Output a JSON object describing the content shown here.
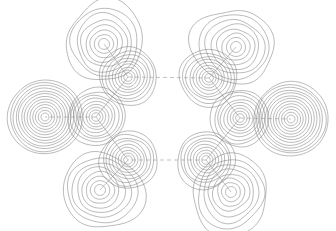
{
  "figure": {
    "title": "",
    "caption": "",
    "background_color": "#ffffff",
    "width": 336,
    "height": 231,
    "contour_color": "#808080",
    "bond_color": "#9a9a9a"
  },
  "chart_data": {
    "type": "contour",
    "title": "",
    "subtitle": "",
    "xlabel": "",
    "ylabel": "",
    "xlim": [
      0,
      336
    ],
    "ylim": [
      0,
      231
    ],
    "grid": false,
    "legend": null,
    "axes_visible": false,
    "tick_labels_x": [],
    "tick_labels_y": [],
    "annotations": [],
    "contour_levels": [
      0.002,
      0.004,
      0.008,
      0.02,
      0.04,
      0.08,
      0.2,
      0.4
    ],
    "ring_center": [
      168,
      115
    ],
    "ring_radius": 55,
    "sites": [
      {
        "id": "ring-atom-1",
        "role": "ring",
        "label": "",
        "center": [
          128,
          77
        ],
        "rings": 9,
        "max_radius": 27,
        "shape": "round",
        "angle_deg": 135
      },
      {
        "id": "ring-atom-2",
        "role": "ring",
        "label": "",
        "center": [
          209,
          78
        ],
        "rings": 9,
        "max_radius": 27,
        "shape": "round",
        "angle_deg": 45
      },
      {
        "id": "ring-atom-3",
        "role": "ring",
        "label": "",
        "center": [
          240,
          118
        ],
        "rings": 9,
        "max_radius": 27,
        "shape": "round",
        "angle_deg": 0
      },
      {
        "id": "ring-atom-4",
        "role": "ring",
        "label": "",
        "center": [
          206,
          160
        ],
        "rings": 9,
        "max_radius": 27,
        "shape": "round",
        "angle_deg": -45
      },
      {
        "id": "ring-atom-5",
        "role": "ring",
        "label": "",
        "center": [
          128,
          160
        ],
        "rings": 9,
        "max_radius": 27,
        "shape": "round",
        "angle_deg": -135
      },
      {
        "id": "ring-atom-6",
        "role": "ring",
        "label": "",
        "center": [
          96,
          117
        ],
        "rings": 9,
        "max_radius": 27,
        "shape": "round",
        "angle_deg": 180
      },
      {
        "id": "substituent-1",
        "role": "substituent",
        "label": "",
        "center": [
          104,
          44
        ],
        "rings": 8,
        "max_radius": 36,
        "shape": "lobed",
        "angle_deg": 135
      },
      {
        "id": "substituent-2",
        "role": "substituent",
        "label": "",
        "center": [
          236,
          47
        ],
        "rings": 8,
        "max_radius": 36,
        "shape": "lobed",
        "angle_deg": 45
      },
      {
        "id": "substituent-3",
        "role": "substituent",
        "label": "",
        "center": [
          291,
          119
        ],
        "rings": 13,
        "max_radius": 36,
        "shape": "round-dense",
        "angle_deg": 0
      },
      {
        "id": "substituent-4",
        "role": "substituent",
        "label": "",
        "center": [
          231,
          192
        ],
        "rings": 8,
        "max_radius": 36,
        "shape": "lobed",
        "angle_deg": -45
      },
      {
        "id": "substituent-5",
        "role": "substituent",
        "label": "",
        "center": [
          100,
          190
        ],
        "rings": 8,
        "max_radius": 36,
        "shape": "lobed",
        "angle_deg": -135
      },
      {
        "id": "substituent-6",
        "role": "substituent",
        "label": "",
        "center": [
          45,
          117
        ],
        "rings": 13,
        "max_radius": 36,
        "shape": "round-dense",
        "angle_deg": 180
      }
    ],
    "bonds": [
      {
        "id": "bond-ring-1-2",
        "from": "ring-atom-1",
        "to": "ring-atom-2",
        "style": "dashed"
      },
      {
        "id": "bond-ring-2-3",
        "from": "ring-atom-2",
        "to": "ring-atom-3",
        "style": "solid"
      },
      {
        "id": "bond-ring-3-4",
        "from": "ring-atom-3",
        "to": "ring-atom-4",
        "style": "solid"
      },
      {
        "id": "bond-ring-4-5",
        "from": "ring-atom-4",
        "to": "ring-atom-5",
        "style": "dashed"
      },
      {
        "id": "bond-ring-5-6",
        "from": "ring-atom-5",
        "to": "ring-atom-6",
        "style": "solid"
      },
      {
        "id": "bond-ring-6-1",
        "from": "ring-atom-6",
        "to": "ring-atom-1",
        "style": "solid"
      },
      {
        "id": "bond-sub-1",
        "from": "ring-atom-1",
        "to": "substituent-1",
        "style": "solid"
      },
      {
        "id": "bond-sub-2",
        "from": "ring-atom-2",
        "to": "substituent-2",
        "style": "solid"
      },
      {
        "id": "bond-sub-3",
        "from": "ring-atom-3",
        "to": "substituent-3",
        "style": "dashed"
      },
      {
        "id": "bond-sub-4",
        "from": "ring-atom-4",
        "to": "substituent-4",
        "style": "solid"
      },
      {
        "id": "bond-sub-5",
        "from": "ring-atom-5",
        "to": "substituent-5",
        "style": "solid"
      },
      {
        "id": "bond-sub-6",
        "from": "ring-atom-6",
        "to": "substituent-6",
        "style": "dashed"
      }
    ]
  }
}
